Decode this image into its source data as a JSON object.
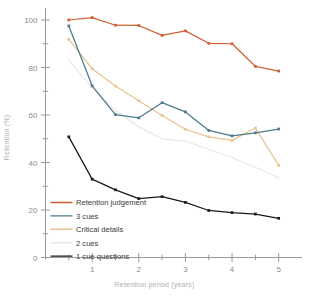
{
  "chart_data": {
    "type": "line",
    "title": "",
    "xlabel": "Retention period (years)",
    "ylabel": "Retention (%)",
    "xlim": [
      0,
      5.5
    ],
    "ylim": [
      0,
      105
    ],
    "grid": false,
    "legend_position": "bottom-left",
    "xticks": [
      1,
      2,
      3,
      4,
      5
    ],
    "xtick_labels": [
      "1",
      "2",
      "3",
      "4",
      "5"
    ],
    "xminor_ticks": [
      0.5,
      1.5,
      2.5,
      3.5,
      4.5
    ],
    "yticks": [
      0,
      20,
      40,
      60,
      80,
      100
    ],
    "ytick_labels": [
      "0",
      "20",
      "40",
      "60",
      "80",
      "100"
    ],
    "yminor_ticks": [
      10,
      30,
      50,
      70,
      90
    ],
    "x": [
      0.5,
      1.0,
      1.5,
      2.0,
      2.5,
      3.0,
      3.5,
      4.0,
      4.5,
      5.0
    ],
    "series": [
      {
        "name": "Retention judgement",
        "color": "#cf5f2e",
        "marker": "square",
        "values": [
          100.0,
          101.0,
          97.8,
          97.7,
          93.5,
          95.4,
          90.2,
          90.0,
          80.5,
          78.5
        ]
      },
      {
        "name": "3 cues",
        "color": "#4b7b8c",
        "marker": "square",
        "values": [
          97.5,
          72.3,
          60.2,
          58.8,
          65.2,
          61.3,
          53.5,
          51.2,
          52.5,
          54.1
        ]
      },
      {
        "name": "Critical details",
        "color": "#e9c492",
        "marker": "square",
        "values": [
          91.8,
          79.5,
          72.2,
          66.0,
          59.8,
          54.0,
          50.8,
          49.3,
          54.5,
          38.8
        ]
      },
      {
        "name": "2 cues",
        "color": "#ece9e4",
        "marker": "none",
        "values": [
          83.0,
          71.5,
          62.0,
          55.0,
          50.0,
          49.0,
          45.5,
          42.0,
          38.0,
          33.5
        ]
      },
      {
        "name": "1 cue questions",
        "color": "#19191a",
        "marker": "square",
        "values": [
          50.8,
          33.0,
          28.5,
          24.8,
          25.6,
          23.2,
          19.8,
          18.9,
          18.3,
          16.5
        ]
      }
    ]
  },
  "legend": {
    "entries": [
      {
        "label": "Retention judgement",
        "color": "#cf5f2e"
      },
      {
        "label": "3 cues",
        "color": "#4b7b8c"
      },
      {
        "label": "Critical details",
        "color": "#e9c492"
      },
      {
        "label": "2 cues",
        "color": "#ece9e4"
      },
      {
        "label": "1 cue questions",
        "color": "#19191a"
      }
    ]
  }
}
